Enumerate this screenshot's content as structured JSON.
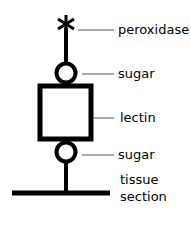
{
  "diagram": {
    "labels": {
      "peroxidase": "peroxidase",
      "sugar_top": "sugar",
      "lectin": "lectin",
      "sugar_bottom": "sugar",
      "tissue_line1": "tissue",
      "tissue_line2": "section"
    },
    "colors": {
      "stroke": "#000000",
      "leader": "#555555"
    }
  }
}
